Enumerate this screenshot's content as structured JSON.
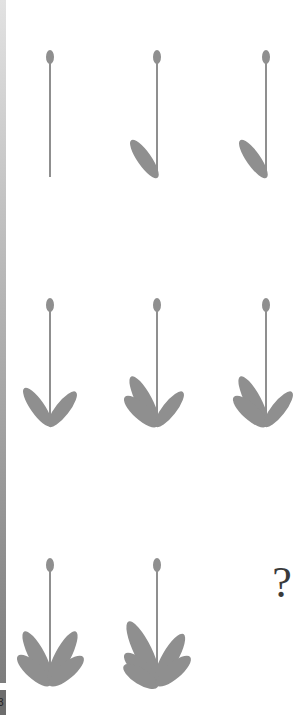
{
  "puzzle": {
    "type": "visual-sequence-matrix",
    "rows": 3,
    "cols": 3,
    "figure_color": "#8f8f8f",
    "missing_symbol": "?",
    "strip_label": "3",
    "cells": [
      {
        "row": 1,
        "col": 1,
        "figure": "stem-with-bud",
        "left_leaves": 0,
        "right_leaves": 0
      },
      {
        "row": 1,
        "col": 2,
        "figure": "stem-with-bud",
        "left_leaves": 1,
        "right_leaves": 0
      },
      {
        "row": 1,
        "col": 3,
        "figure": "stem-with-bud",
        "left_leaves": 1,
        "right_leaves": 0
      },
      {
        "row": 2,
        "col": 1,
        "figure": "stem-with-bud",
        "left_leaves": 1,
        "right_leaves": 1
      },
      {
        "row": 2,
        "col": 2,
        "figure": "stem-with-bud",
        "left_leaves": 2,
        "right_leaves": 1
      },
      {
        "row": 2,
        "col": 3,
        "figure": "stem-with-bud",
        "left_leaves": 2,
        "right_leaves": 1
      },
      {
        "row": 3,
        "col": 1,
        "figure": "stem-with-bud",
        "left_leaves": 2,
        "right_leaves": 2
      },
      {
        "row": 3,
        "col": 2,
        "figure": "stem-with-bud",
        "left_leaves": 3,
        "right_leaves": 2
      },
      {
        "row": 3,
        "col": 3,
        "figure": "missing",
        "label": "?"
      }
    ]
  }
}
